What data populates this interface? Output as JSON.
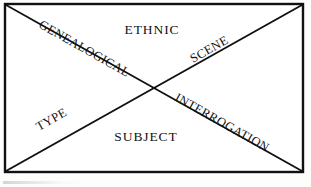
{
  "figure": {
    "type": "x-quadrant-diagram",
    "shape": "rectangle-with-two-diagonals",
    "background_color": "#fdfdfb",
    "line_color": "#111111",
    "text_color": "#121212"
  },
  "labels": {
    "top": "ETHNIC",
    "bottom": "SUBJECT",
    "upper_left_diagonal": "GENEALOGICAL",
    "upper_right_diagonal": "SCENE",
    "lower_left_diagonal": "TYPE",
    "lower_right_diagonal": "INTERROGATION"
  },
  "regions": [
    {
      "id": "top-triangle",
      "label": "ETHNIC",
      "orientation": "horizontal"
    },
    {
      "id": "bottom-triangle",
      "label": "SUBJECT",
      "orientation": "horizontal"
    },
    {
      "id": "left-triangle-upper-edge",
      "label": "GENEALOGICAL",
      "orientation": "rotated-descending"
    },
    {
      "id": "right-triangle-upper-edge",
      "label": "SCENE",
      "orientation": "rotated-ascending"
    },
    {
      "id": "left-triangle-lower-edge",
      "label": "TYPE",
      "orientation": "rotated-ascending"
    },
    {
      "id": "right-triangle-lower-edge",
      "label": "INTERROGATION",
      "orientation": "rotated-descending"
    }
  ],
  "geometry": {
    "frame": {
      "x": 5,
      "y": 4,
      "width": 298,
      "height": 168
    },
    "diagonal_descending": {
      "x1": 5,
      "y1": 4,
      "x2": 303,
      "y2": 172
    },
    "diagonal_ascending": {
      "x1": 5,
      "y1": 172,
      "x2": 303,
      "y2": 4
    }
  }
}
